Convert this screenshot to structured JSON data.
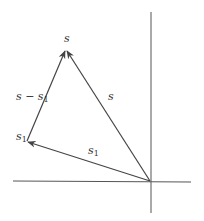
{
  "diagram": {
    "type": "vector-subtraction",
    "colors": {
      "axis": "#555555",
      "vector": "#444444",
      "text": "#333333"
    },
    "axes": {
      "origin": [
        150,
        181
      ],
      "horizontal": {
        "from": [
          13,
          181
        ],
        "to": [
          191,
          181
        ]
      },
      "vertical": {
        "from": [
          151,
          12
        ],
        "to": [
          151,
          213
        ]
      }
    },
    "vectors": [
      {
        "id": "s",
        "from": [
          150,
          181
        ],
        "to": [
          66,
          50
        ],
        "label": "s"
      },
      {
        "id": "s1",
        "from": [
          150,
          181
        ],
        "to": [
          27,
          141
        ],
        "label": "s1"
      },
      {
        "id": "s-minus-s1",
        "from": [
          27,
          141
        ],
        "to": [
          66,
          50
        ],
        "label": "s − s1"
      }
    ],
    "labels": {
      "tip_s": {
        "base": "s",
        "sub": ""
      },
      "vector_s_minus_s1": {
        "base": "s − s",
        "sub": "1"
      },
      "vector_s": {
        "base": "s",
        "sub": ""
      },
      "tip_s1": {
        "base": "s",
        "sub": "1"
      },
      "vector_s1": {
        "base": "s",
        "sub": "1"
      }
    }
  }
}
